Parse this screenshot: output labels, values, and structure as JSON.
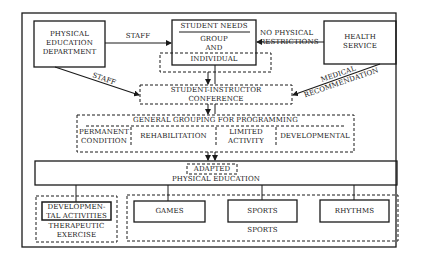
{
  "diagram": {
    "nodes": {
      "pe_department": {
        "lines": [
          "PHYSICAL",
          "EDUCATION",
          "DEPARTMENT"
        ]
      },
      "student_needs": {
        "title": "STUDENT NEEDS",
        "lines": [
          "GROUP",
          "AND"
        ]
      },
      "individual": {
        "label": "INDIVIDUAL"
      },
      "health_service": {
        "lines": [
          "HEALTH",
          "SERVICE"
        ]
      },
      "conference": {
        "lines": [
          "STUDENT-INSTRUCTOR",
          "CONFERENCE"
        ]
      },
      "general_grouping": {
        "title": "GENERAL GROUPING FOR PROGRAMMING",
        "categories": [
          {
            "lines": [
              "PERMANENT",
              "CONDITION"
            ]
          },
          {
            "lines": [
              "REHABILITATION"
            ]
          },
          {
            "lines": [
              "LIMITED",
              "ACTIVITY"
            ]
          },
          {
            "lines": [
              "DEVELOPMENTAL"
            ]
          }
        ]
      },
      "adapted_pe": {
        "tag": "ADAPTED",
        "label": "PHYSICAL EDUCATION"
      },
      "therapeutic": {
        "inner_lines": [
          "DEVELOPMEN-",
          "TAL ACTIVITIES"
        ],
        "caption_lines": [
          "THERAPEUTIC",
          "EXERCISE"
        ]
      },
      "sports_group": {
        "items": [
          "GAMES",
          "SPORTS",
          "RHYTHMS"
        ],
        "caption": "SPORTS"
      }
    },
    "edges": {
      "staff_top": "STAFF",
      "staff_diag": "STAFF",
      "no_physical": [
        "NO PHYSICAL",
        "RESTRICTIONS"
      ],
      "medical": [
        "MEDICAL",
        "RECOMMENDATION"
      ]
    },
    "colors": {
      "stroke": "#1a1a1a",
      "background": "#ffffff"
    }
  }
}
